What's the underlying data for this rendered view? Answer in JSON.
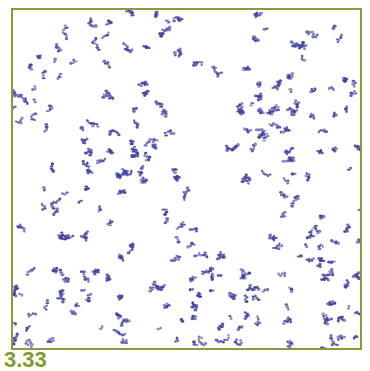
{
  "figure": {
    "label": "3.33",
    "frame_color": "#8a9a3a",
    "label_color": "#7f9a2e",
    "cell_color": "#3c3f9c"
  }
}
